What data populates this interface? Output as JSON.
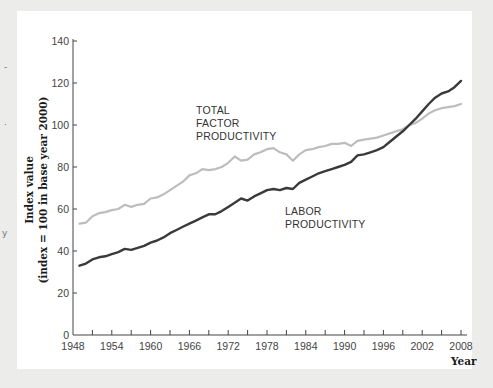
{
  "chart_data": {
    "type": "line",
    "title": "",
    "xlabel": "Year",
    "ylabel": "Index value (index = 100 in base year 2000)",
    "ylabel_lines": [
      "Index value",
      "(index = 100 in base year 2000)"
    ],
    "xlim": [
      1948,
      2008
    ],
    "ylim": [
      0,
      140
    ],
    "x_ticks": [
      1948,
      1954,
      1960,
      1966,
      1972,
      1978,
      1984,
      1990,
      1996,
      2002,
      2008
    ],
    "x_minor_ticks_every": 3,
    "y_ticks": [
      0,
      20,
      40,
      60,
      80,
      100,
      120,
      140
    ],
    "grid": false,
    "legend": "inline annotations",
    "series": [
      {
        "name": "Total Factor Productivity",
        "label_lines": [
          "TOTAL",
          "FACTOR",
          "PRODUCTIVITY"
        ],
        "color": "#bdbdbd",
        "x": [
          1949,
          1950,
          1951,
          1952,
          1953,
          1954,
          1955,
          1956,
          1957,
          1958,
          1959,
          1960,
          1961,
          1962,
          1963,
          1964,
          1965,
          1966,
          1967,
          1968,
          1969,
          1970,
          1971,
          1972,
          1973,
          1974,
          1975,
          1976,
          1977,
          1978,
          1979,
          1980,
          1981,
          1982,
          1983,
          1984,
          1985,
          1986,
          1987,
          1988,
          1989,
          1990,
          1991,
          1992,
          1993,
          1994,
          1995,
          1996,
          1997,
          1998,
          1999,
          2000,
          2001,
          2002,
          2003,
          2004,
          2005,
          2006,
          2007,
          2008
        ],
        "values": [
          53,
          53.5,
          56.5,
          58,
          58.5,
          59.5,
          60,
          62,
          61,
          62,
          62.5,
          65,
          65.5,
          67,
          69,
          71,
          73,
          76,
          77,
          79,
          78.5,
          79,
          80,
          82,
          85,
          83,
          83.5,
          86,
          87,
          88.5,
          89,
          87,
          86,
          83,
          86,
          88,
          88.5,
          89.5,
          90,
          91,
          91,
          91.5,
          90,
          92.5,
          93,
          93.5,
          94,
          95,
          96,
          97,
          98,
          100,
          101,
          103,
          105.5,
          107,
          108,
          108.5,
          109,
          110
        ]
      },
      {
        "name": "Labor Productivity",
        "label_lines": [
          "LABOR",
          "PRODUCTIVITY"
        ],
        "color": "#3a3a3a",
        "x": [
          1949,
          1950,
          1951,
          1952,
          1953,
          1954,
          1955,
          1956,
          1957,
          1958,
          1959,
          1960,
          1961,
          1962,
          1963,
          1964,
          1965,
          1966,
          1967,
          1968,
          1969,
          1970,
          1971,
          1972,
          1973,
          1974,
          1975,
          1976,
          1977,
          1978,
          1979,
          1980,
          1981,
          1982,
          1983,
          1984,
          1985,
          1986,
          1987,
          1988,
          1989,
          1990,
          1991,
          1992,
          1993,
          1994,
          1995,
          1996,
          1997,
          1998,
          1999,
          2000,
          2001,
          2002,
          2003,
          2004,
          2005,
          2006,
          2007,
          2008
        ],
        "values": [
          33,
          34,
          36,
          37,
          37.5,
          38.5,
          39.5,
          41,
          40.5,
          41.5,
          42.5,
          44,
          45,
          46.5,
          48.5,
          50,
          51.5,
          53,
          54.5,
          56,
          57.5,
          57.5,
          59,
          61,
          63,
          65,
          64,
          66,
          67.5,
          69,
          69.5,
          69,
          70,
          69.5,
          72.5,
          74,
          75.5,
          77,
          78,
          79,
          80,
          81,
          82.5,
          85.5,
          86,
          87,
          88,
          89.5,
          92,
          94.5,
          97,
          100,
          103,
          106.5,
          110,
          113,
          115,
          116,
          118,
          121
        ]
      }
    ]
  },
  "side_marks": [
    "-",
    "·",
    "y"
  ]
}
